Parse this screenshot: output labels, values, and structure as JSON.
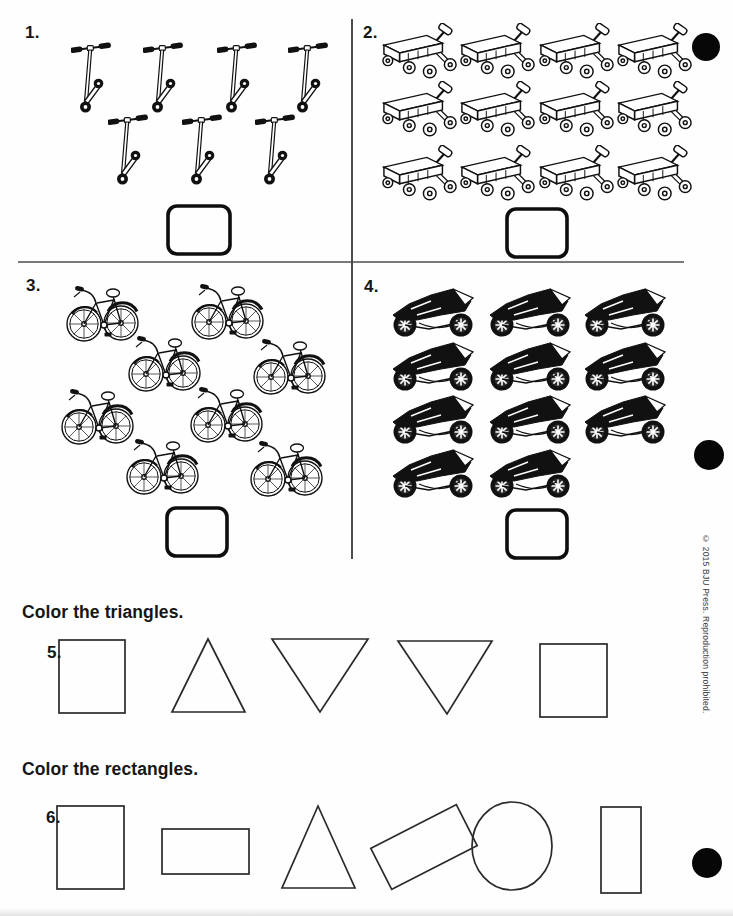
{
  "page": {
    "background": "#fefefe",
    "ink": "#161616"
  },
  "copyright": "© 2015 BJU Press. Reproduction prohibited.",
  "counting_problems": [
    {
      "number": "1.",
      "item": "scooter",
      "count": 7,
      "answer": ""
    },
    {
      "number": "2.",
      "item": "wagon",
      "count": 12,
      "answer": ""
    },
    {
      "number": "3.",
      "item": "bicycle",
      "count": 8,
      "answer": ""
    },
    {
      "number": "4.",
      "item": "motorcycle",
      "count": 11,
      "answer": ""
    }
  ],
  "shape_problems": [
    {
      "number": "5.",
      "instruction": "Color the triangles.",
      "shapes": [
        "square",
        "triangle-up",
        "triangle-down",
        "triangle-down",
        "square"
      ]
    },
    {
      "number": "6.",
      "instruction": "Color the rectangles.",
      "shapes": [
        "rectangle-tall",
        "rectangle-wide",
        "triangle-up",
        "rectangle-rotated",
        "circle",
        "rectangle-narrow"
      ]
    }
  ],
  "registration_dots": [
    {
      "x": 706,
      "y": 47,
      "r": 14
    },
    {
      "x": 709,
      "y": 455,
      "r": 15
    },
    {
      "x": 707,
      "y": 863,
      "r": 15
    }
  ]
}
